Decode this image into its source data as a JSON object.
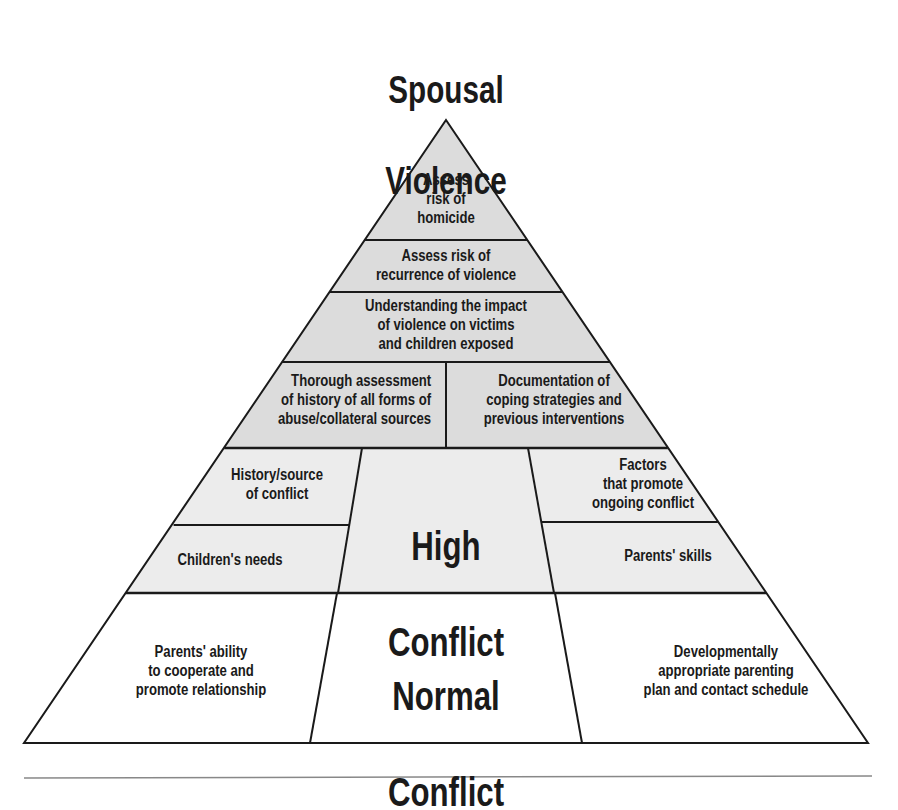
{
  "title": {
    "line1": "Spousal",
    "line2": "Violence"
  },
  "colors": {
    "gray_fill": "#dcdcdc",
    "light_fill": "#ececec",
    "white_fill": "#ffffff",
    "line": "#1a1a1a",
    "rule": "#888888"
  },
  "levels": {
    "apex": {
      "text": "Assess\nrisk of\nhomicide"
    },
    "recurrence": {
      "text": "Assess risk of\nrecurrence of violence"
    },
    "impact": {
      "text": "Understanding the impact\nof violence on victims\nand children exposed"
    },
    "assessment": {
      "left": "Thorough assessment\nof history of all forms of\nabuse/collateral sources",
      "right": "Documentation of\ncoping strategies and\nprevious interventions"
    },
    "high_conflict": {
      "label_line1": "High",
      "label_line2": "Conflict",
      "left_top": "History/source\nof conflict",
      "left_bottom": "Children's needs",
      "right_top": "Factors\nthat promote\nongoing conflict",
      "right_bottom": "Parents' skills"
    },
    "normal_conflict": {
      "label_line1": "Normal",
      "label_line2": "Conflict",
      "left": "Parents' ability\nto cooperate and\npromote relationship",
      "right": "Developmentally\nappropriate parenting\nplan and contact schedule"
    }
  }
}
